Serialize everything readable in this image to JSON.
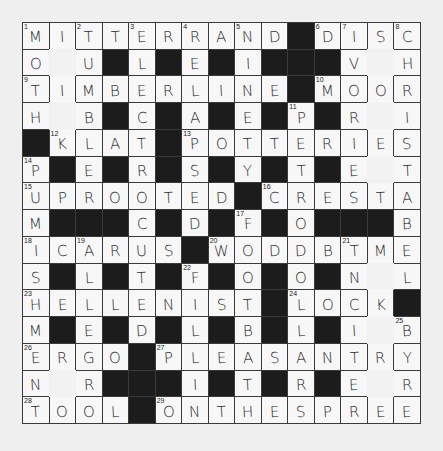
{
  "puzzle": {
    "rows": 15,
    "cols": 15,
    "legend": {
      "#": "black square",
      "_": "unchecked blank square"
    },
    "grid": [
      [
        "M",
        "I",
        "T",
        "T",
        "E",
        "R",
        "R",
        "A",
        "N",
        "D",
        "#",
        "D",
        "I",
        "S",
        "C"
      ],
      [
        "O",
        "_",
        "U",
        "#",
        "L",
        "#",
        "E",
        "#",
        "I",
        "#",
        "#",
        "#",
        "V",
        "_",
        "H"
      ],
      [
        "T",
        "I",
        "M",
        "B",
        "E",
        "R",
        "L",
        "I",
        "N",
        "E",
        "#",
        "M",
        "O",
        "O",
        "R"
      ],
      [
        "H",
        "_",
        "B",
        "#",
        "C",
        "#",
        "A",
        "#",
        "E",
        "#",
        "P",
        "#",
        "R",
        "_",
        "I"
      ],
      [
        "#",
        "K",
        "L",
        "A",
        "T",
        "#",
        "P",
        "O",
        "T",
        "T",
        "E",
        "R",
        "I",
        "E",
        "S"
      ],
      [
        "P",
        "#",
        "E",
        "#",
        "R",
        "#",
        "S",
        "#",
        "Y",
        "#",
        "T",
        "#",
        "E",
        "_",
        "T"
      ],
      [
        "U",
        "P",
        "R",
        "O",
        "O",
        "T",
        "E",
        "D",
        "#",
        "C",
        "R",
        "E",
        "S",
        "T",
        "A"
      ],
      [
        "M",
        "#",
        "#",
        "#",
        "C",
        "#",
        "D",
        "#",
        "F",
        "#",
        "O",
        "#",
        "#",
        "#",
        "B"
      ],
      [
        "I",
        "C",
        "A",
        "R",
        "U",
        "S",
        "#",
        "W",
        "O",
        "D",
        "D",
        "B",
        "T",
        "M",
        "E"
      ],
      [
        "S",
        "#",
        "L",
        "#",
        "T",
        "#",
        "F",
        "#",
        "O",
        "#",
        "O",
        "#",
        "N",
        "_",
        "L"
      ],
      [
        "H",
        "E",
        "L",
        "L",
        "E",
        "N",
        "I",
        "S",
        "T",
        "#",
        "L",
        "O",
        "C",
        "K",
        "#"
      ],
      [
        "M",
        "#",
        "E",
        "#",
        "D",
        "#",
        "L",
        "#",
        "B",
        "#",
        "L",
        "#",
        "I",
        "_",
        "B"
      ],
      [
        "E",
        "R",
        "G",
        "O",
        "#",
        "P",
        "L",
        "E",
        "A",
        "S",
        "A",
        "N",
        "T",
        "R",
        "Y"
      ],
      [
        "N",
        "_",
        "R",
        "#",
        "#",
        "#",
        "I",
        "#",
        "T",
        "#",
        "R",
        "#",
        "E",
        "_",
        "R"
      ],
      [
        "T",
        "O",
        "O",
        "L",
        "#",
        "O",
        "N",
        "T",
        "H",
        "E",
        "S",
        "P",
        "R",
        "E",
        "E"
      ]
    ],
    "numbers": [
      {
        "n": 1,
        "r": 1,
        "c": 1
      },
      {
        "n": 2,
        "r": 1,
        "c": 3
      },
      {
        "n": 3,
        "r": 1,
        "c": 5
      },
      {
        "n": 4,
        "r": 1,
        "c": 7
      },
      {
        "n": 5,
        "r": 1,
        "c": 9
      },
      {
        "n": 6,
        "r": 1,
        "c": 12
      },
      {
        "n": 7,
        "r": 1,
        "c": 13
      },
      {
        "n": 8,
        "r": 1,
        "c": 15
      },
      {
        "n": 9,
        "r": 3,
        "c": 1
      },
      {
        "n": 10,
        "r": 3,
        "c": 12
      },
      {
        "n": 11,
        "r": 4,
        "c": 11
      },
      {
        "n": 12,
        "r": 5,
        "c": 2
      },
      {
        "n": 13,
        "r": 5,
        "c": 7
      },
      {
        "n": 14,
        "r": 6,
        "c": 1
      },
      {
        "n": 15,
        "r": 7,
        "c": 1
      },
      {
        "n": 16,
        "r": 7,
        "c": 10
      },
      {
        "n": 17,
        "r": 8,
        "c": 9
      },
      {
        "n": 18,
        "r": 9,
        "c": 1
      },
      {
        "n": 19,
        "r": 9,
        "c": 3
      },
      {
        "n": 20,
        "r": 9,
        "c": 8
      },
      {
        "n": 21,
        "r": 9,
        "c": 13
      },
      {
        "n": 22,
        "r": 10,
        "c": 7
      },
      {
        "n": 23,
        "r": 11,
        "c": 1
      },
      {
        "n": 24,
        "r": 11,
        "c": 11
      },
      {
        "n": 25,
        "r": 12,
        "c": 15
      },
      {
        "n": 26,
        "r": 13,
        "c": 1
      },
      {
        "n": 27,
        "r": 13,
        "c": 6
      },
      {
        "n": 28,
        "r": 15,
        "c": 1
      },
      {
        "n": 29,
        "r": 15,
        "c": 6
      }
    ]
  },
  "colors": {
    "paper": "#efefef",
    "cell": "#f7f7f7",
    "black_square": "#1c1c1c",
    "ink": "#2a2a2a"
  }
}
